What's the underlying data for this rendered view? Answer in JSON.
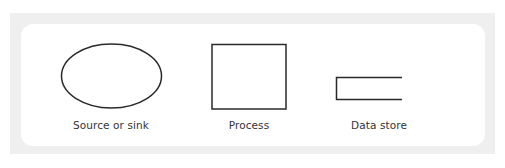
{
  "diagram": {
    "type": "legend",
    "colors": {
      "panel_frame": "#efefef",
      "panel_fill": "#ffffff",
      "stroke": "#2a2a2a",
      "text": "#333333"
    },
    "symbols": [
      {
        "shape": "ellipse",
        "label": "Source or sink"
      },
      {
        "shape": "square",
        "label": "Process"
      },
      {
        "shape": "open-rectangle",
        "label": "Data store"
      }
    ]
  }
}
